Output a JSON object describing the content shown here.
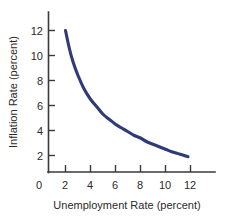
{
  "chart_data": {
    "type": "line",
    "title": "",
    "xlabel": "Unemployment Rate (percent)",
    "ylabel": "Inflation Rate (percent)",
    "xlim": [
      0,
      13.5
    ],
    "ylim": [
      0,
      13.2
    ],
    "xticks": [
      0,
      2,
      4,
      6,
      8,
      10,
      12
    ],
    "xtick_labels": [
      "0",
      "2",
      "4",
      "6",
      "8",
      "10",
      "12"
    ],
    "yticks": [
      2,
      4,
      6,
      8,
      10,
      12
    ],
    "ytick_labels": [
      "2",
      "4",
      "6",
      "8",
      "10",
      "12"
    ],
    "grid": false,
    "legend": null,
    "series": [
      {
        "name": "Phillips curve",
        "color": "#2f3a78",
        "x": [
          2.0,
          2.3,
          2.6,
          3.0,
          3.5,
          4.0,
          4.5,
          5.0,
          5.5,
          6.0,
          6.5,
          7.0,
          7.5,
          8.0,
          8.5,
          9.0,
          9.5,
          10.0,
          10.5,
          11.0,
          11.5,
          11.8
        ],
        "y": [
          12.0,
          10.6,
          9.5,
          8.4,
          7.3,
          6.5,
          5.9,
          5.3,
          4.9,
          4.5,
          4.2,
          3.9,
          3.6,
          3.4,
          3.1,
          2.9,
          2.7,
          2.5,
          2.3,
          2.15,
          2.0,
          1.9
        ]
      }
    ]
  },
  "axes": {
    "x_title": "Unemployment Rate (percent)",
    "y_title": "Inflation Rate (percent)"
  },
  "colors": {
    "curve": "#2f3a78",
    "axis": "#3a3a3a",
    "text": "#2b2b2b",
    "background": "#ffffff"
  }
}
